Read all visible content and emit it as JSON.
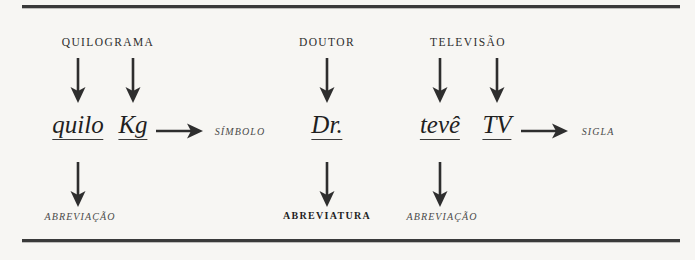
{
  "figure": {
    "groups": [
      {
        "source": "QUILOGRAMA",
        "forms": [
          "quilo",
          "Kg"
        ],
        "right_result": "SÍMBOLO",
        "bottom_result": "ABREVIAÇÃO"
      },
      {
        "source": "DOUTOR",
        "forms": [
          "Dr."
        ],
        "right_result": "",
        "bottom_result": "ABREVIATURA"
      },
      {
        "source": "TELEVISÃO",
        "forms": [
          "tevê",
          "TV"
        ],
        "right_result": "SIGLA",
        "bottom_result": "ABREVIAÇÃO"
      }
    ],
    "colors": {
      "ink": "#2b2b2b",
      "rule": "#3a3a3a",
      "background": "#f7f6f3"
    }
  }
}
